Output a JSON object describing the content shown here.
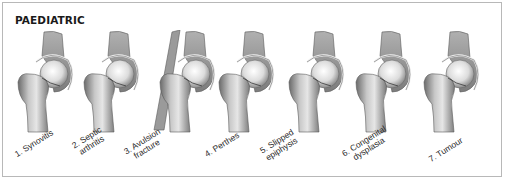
{
  "figure": {
    "title": "PAEDIATRIC",
    "colors": {
      "border": "#b8b8b8",
      "bone_light": "#e8e8e8",
      "bone_mid": "#a8a8a8",
      "bone_dark": "#5a5a5a",
      "pelvis": "#8c8c8c",
      "text": "#2a2a2a"
    },
    "items": [
      {
        "number": "1.",
        "line1": "1. Synovitis",
        "line2": ""
      },
      {
        "number": "2.",
        "line1": "2. Septic",
        "line2": "arthritis"
      },
      {
        "number": "3.",
        "line1": "3. Avulsion",
        "line2": "fracture"
      },
      {
        "number": "4.",
        "line1": "4. Perthes",
        "line2": ""
      },
      {
        "number": "5.",
        "line1": "5. Slipped",
        "line2": "epiphysis"
      },
      {
        "number": "6.",
        "line1": "6. Congenital",
        "line2": "dysplasia"
      },
      {
        "number": "7.",
        "line1": "7. Tumour",
        "line2": ""
      }
    ]
  }
}
